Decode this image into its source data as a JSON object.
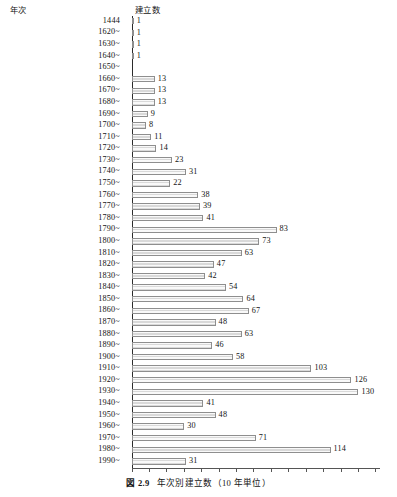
{
  "header": {
    "year_label": "年次",
    "count_label": "建立数"
  },
  "caption": {
    "figure_number": "図 2.9",
    "title": "年次別建立数（10 年単位）"
  },
  "chart_data": {
    "type": "bar",
    "orientation": "horizontal",
    "title": "年次別建立数（10 年単位）",
    "xlabel": "建立数",
    "ylabel": "年次",
    "grid": false,
    "legend": null,
    "xlim": [
      0,
      143
    ],
    "axis_ticks_labeled": false,
    "categories": [
      "1444",
      "1620~",
      "1630~",
      "1640~",
      "1650~",
      "1660~",
      "1670~",
      "1680~",
      "1690~",
      "1700~",
      "1710~",
      "1720~",
      "1730~",
      "1740~",
      "1750~",
      "1760~",
      "1770~",
      "1780~",
      "1790~",
      "1800~",
      "1810~",
      "1820~",
      "1830~",
      "1840~",
      "1850~",
      "1860~",
      "1870~",
      "1880~",
      "1890~",
      "1900~",
      "1910~",
      "1920~",
      "1930~",
      "1940~",
      "1950~",
      "1960~",
      "1970~",
      "1980~",
      "1990~"
    ],
    "values": [
      1,
      1,
      1,
      1,
      0,
      13,
      13,
      13,
      9,
      8,
      11,
      14,
      23,
      31,
      22,
      38,
      39,
      41,
      83,
      73,
      63,
      47,
      42,
      54,
      64,
      67,
      48,
      63,
      46,
      58,
      103,
      126,
      130,
      41,
      48,
      30,
      71,
      114,
      31
    ],
    "value_labels": [
      "1",
      "1",
      "1",
      "1",
      "",
      "13",
      "13",
      "13",
      "9",
      "8",
      "11",
      "14",
      "23",
      "31",
      "22",
      "38",
      "39",
      "41",
      "83",
      "73",
      "63",
      "47",
      "42",
      "54",
      "64",
      "67",
      "48",
      "63",
      "46",
      "58",
      "103",
      "126",
      "130",
      "41",
      "48",
      "30",
      "71",
      "114",
      "31"
    ]
  },
  "colors": {
    "bar_fill": "#d9d9d9",
    "bar_border": "#8e8e8e",
    "axis": "#2b2b2b",
    "text": "#141414"
  }
}
